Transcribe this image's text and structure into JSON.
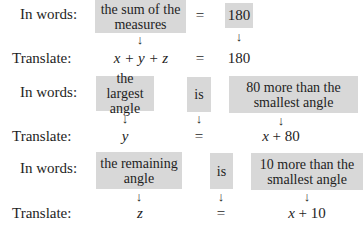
{
  "rows": [
    {
      "words_label": "In words:",
      "translate_label": "Translate:",
      "phrase": "the sum of the measures",
      "equals": "=",
      "value": "180",
      "lhs_math": "x + y + z",
      "rhs_math": "180"
    },
    {
      "words_label": "In words:",
      "translate_label": "Translate:",
      "phrase": "the largest angle",
      "verb": "is",
      "rhs_phrase": "80 more than the smallest angle",
      "lhs_math": "y",
      "equals": "=",
      "rhs_math": "x + 80"
    },
    {
      "words_label": "In words:",
      "translate_label": "Translate:",
      "phrase": "the remaining angle",
      "verb": "is",
      "rhs_phrase": "10 more than the smallest angle",
      "lhs_math": "z",
      "equals": "=",
      "rhs_math": "x + 10"
    }
  ],
  "arrow_glyph": "↓",
  "colors": {
    "box_fill": "#d8d8d8",
    "text": "#1e1e1e"
  }
}
